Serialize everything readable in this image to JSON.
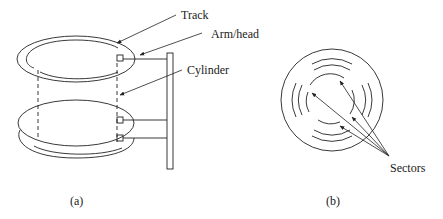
{
  "figure_a": {
    "caption": "(a)",
    "labels": {
      "track": "Track",
      "arm_head": "Arm/head",
      "cylinder": "Cylinder"
    },
    "platters": 3,
    "heads": 3
  },
  "figure_b": {
    "caption": "(b)",
    "labels": {
      "sectors": "Sectors"
    },
    "sector_arrows": 4
  },
  "colors": {
    "line": "#222222",
    "text": "#1a1a1a",
    "background": "#ffffff"
  }
}
